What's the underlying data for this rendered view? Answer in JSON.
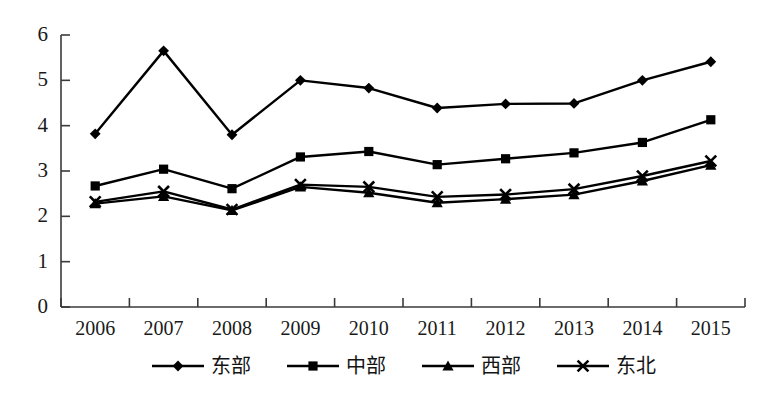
{
  "chart_data": {
    "type": "line",
    "title": "",
    "subtitle": "",
    "xlabel": "",
    "ylabel": "",
    "categories": [
      "2006",
      "2007",
      "2008",
      "2009",
      "2010",
      "2011",
      "2012",
      "2013",
      "2014",
      "2015"
    ],
    "ylim": [
      0,
      6
    ],
    "yticks": [
      "0",
      "1",
      "2",
      "3",
      "4",
      "5",
      "6"
    ],
    "ytick_values": [
      0,
      1,
      2,
      3,
      4,
      5,
      6
    ],
    "grid": false,
    "legend_position": "bottom",
    "series": [
      {
        "name": "东部",
        "marker": "diamond",
        "color": "#000000",
        "values": [
          3.82,
          5.65,
          3.8,
          5.0,
          4.83,
          4.39,
          4.48,
          4.49,
          5.0,
          5.41
        ]
      },
      {
        "name": "中部",
        "marker": "square",
        "color": "#000000",
        "values": [
          2.67,
          3.04,
          2.61,
          3.31,
          3.43,
          3.14,
          3.27,
          3.4,
          3.63,
          4.13
        ]
      },
      {
        "name": "西部",
        "marker": "triangle",
        "color": "#000000",
        "values": [
          2.28,
          2.44,
          2.13,
          2.65,
          2.52,
          2.3,
          2.38,
          2.48,
          2.78,
          3.13
        ]
      },
      {
        "name": "东北",
        "marker": "x",
        "color": "#000000",
        "values": [
          2.32,
          2.55,
          2.15,
          2.7,
          2.65,
          2.43,
          2.48,
          2.6,
          2.89,
          3.22
        ]
      }
    ]
  },
  "legend": {
    "items": [
      {
        "label": "东部",
        "marker": "diamond"
      },
      {
        "label": "中部",
        "marker": "square"
      },
      {
        "label": "西部",
        "marker": "triangle"
      },
      {
        "label": "东北",
        "marker": "x"
      }
    ]
  },
  "caption": {
    "text": ""
  }
}
